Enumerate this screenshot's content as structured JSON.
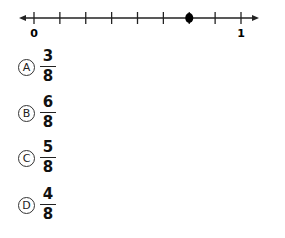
{
  "number_line": {
    "start_label": "0",
    "end_label": "1",
    "min": 0,
    "max": 1,
    "divisions": 8,
    "point_value": 0.75,
    "point_color": "#000000",
    "line_color": "#222222"
  },
  "choices": [
    {
      "letter": "A",
      "numerator": "3",
      "denominator": "8"
    },
    {
      "letter": "B",
      "numerator": "6",
      "denominator": "8"
    },
    {
      "letter": "C",
      "numerator": "5",
      "denominator": "8"
    },
    {
      "letter": "D",
      "numerator": "4",
      "denominator": "8"
    }
  ]
}
